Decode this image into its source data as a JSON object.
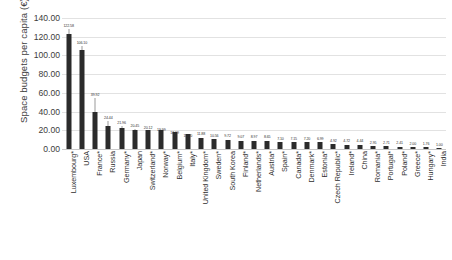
{
  "chart_data": {
    "type": "bar",
    "title": "",
    "xlabel": "",
    "ylabel": "Space budgets per capita (€)",
    "ylim": [
      0,
      140
    ],
    "ytick_labels": [
      "140.00",
      "120.00",
      "100.00",
      "80.00",
      "60.00",
      "40.00",
      "20.00",
      "0.00"
    ],
    "ytick_values": [
      140,
      120,
      100,
      80,
      60,
      40,
      20,
      0
    ],
    "grid": true,
    "legend": "none",
    "bar_color": "#2b2b2b",
    "categories": [
      "Luxembourg*",
      "USA",
      "France*",
      "Russia",
      "Germany*",
      "Japan",
      "Switzerland*",
      "Norway*",
      "Belgium*",
      "Italy*",
      "United Kingdom*",
      "Sweden*",
      "South Korea",
      "Finland*",
      "Netherlands*",
      "Austria*",
      "Spain*",
      "Canada*",
      "Denmark*",
      "Estonia*",
      "Czech Republic*",
      "Ireland*",
      "China",
      "Romania*",
      "Portugal*",
      "Poland*",
      "Greece*",
      "Hungary*",
      "India"
    ],
    "values": [
      122.58,
      106.1,
      39.92,
      24.44,
      21.96,
      20.45,
      20.12,
      19.99,
      18.19,
      15.7,
      11.88,
      10.56,
      9.72,
      9.07,
      8.97,
      8.65,
      7.1,
      7.15,
      7.2,
      6.99,
      4.92,
      4.72,
      4.44,
      2.95,
      2.71,
      2.41,
      2.0,
      1.76,
      1.0
    ],
    "data_labels": [
      "122.58",
      "106.10",
      "39.92",
      "24.44",
      "21.96",
      "20.45",
      "20.12",
      "19.99",
      "18.19",
      "15.70",
      "11.88",
      "10.56",
      "9.72",
      "9.07",
      "8.97",
      "8.65",
      "7.10",
      "7.15",
      "7.20",
      "6.99",
      "4.92",
      "4.72",
      "4.44",
      "2.95",
      "2.71",
      "2.41",
      "2.00",
      "1.76",
      "1.00"
    ]
  }
}
